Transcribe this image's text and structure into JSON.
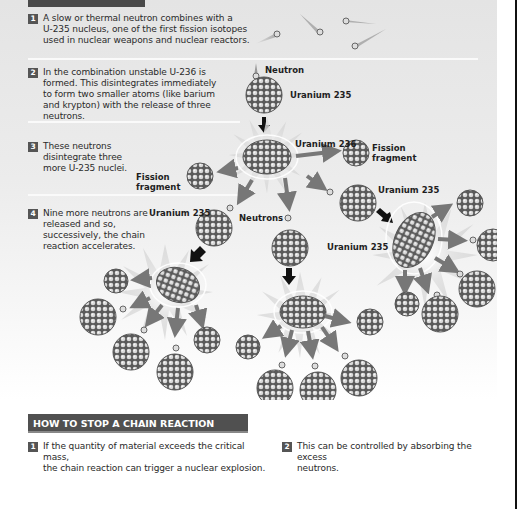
{
  "intro_steps": [
    {
      "number": "1",
      "text": "A slow or thermal neutron combines with a\nU-235 nucleus, one of the first fission isotopes\nused in nuclear weapons and nuclear reactors."
    },
    {
      "number": "2",
      "text": "In the combination unstable U-236 is\nformed. This disintegrates immediately\nto form two smaller atoms (like barium\nand krypton) with the release of three\nneutrons."
    },
    {
      "number": "3",
      "text": "These neutrons\ndisintegrate three\nmore U-235 nuclei."
    },
    {
      "number": "4",
      "text": "Nine more neutrons are\nreleased and so,\nsuccessively, the chain\nreaction accelerates."
    }
  ],
  "diagram": {
    "labels": {
      "neutron": "Neutron",
      "uranium_235_top": "Uranium 235",
      "uranium_236": "Uranium 236",
      "fission_fragment_right": "Fission\nfragment",
      "fission_fragment_left": "Fission\nfragment",
      "uranium_235_right": "Uranium 235",
      "uranium_235_left": "Uranium 235",
      "neutrons": "Neutrons",
      "uranium_235_middle": "Uranium 235"
    },
    "colors": {
      "nucleus": "#5a5a5a",
      "nucleon": "#d8d8d8",
      "arrow": "#777777",
      "black_arrow": "#111111",
      "burst": "#cfcfcf"
    }
  },
  "stop_section": {
    "title": "HOW TO STOP A CHAIN REACTION",
    "steps": [
      {
        "number": "1",
        "text": "If the quantity of material exceeds the critical mass,\nthe chain reaction can trigger a nuclear explosion."
      },
      {
        "number": "2",
        "text": "This can be controlled by absorbing the excess\nneutrons."
      }
    ]
  }
}
